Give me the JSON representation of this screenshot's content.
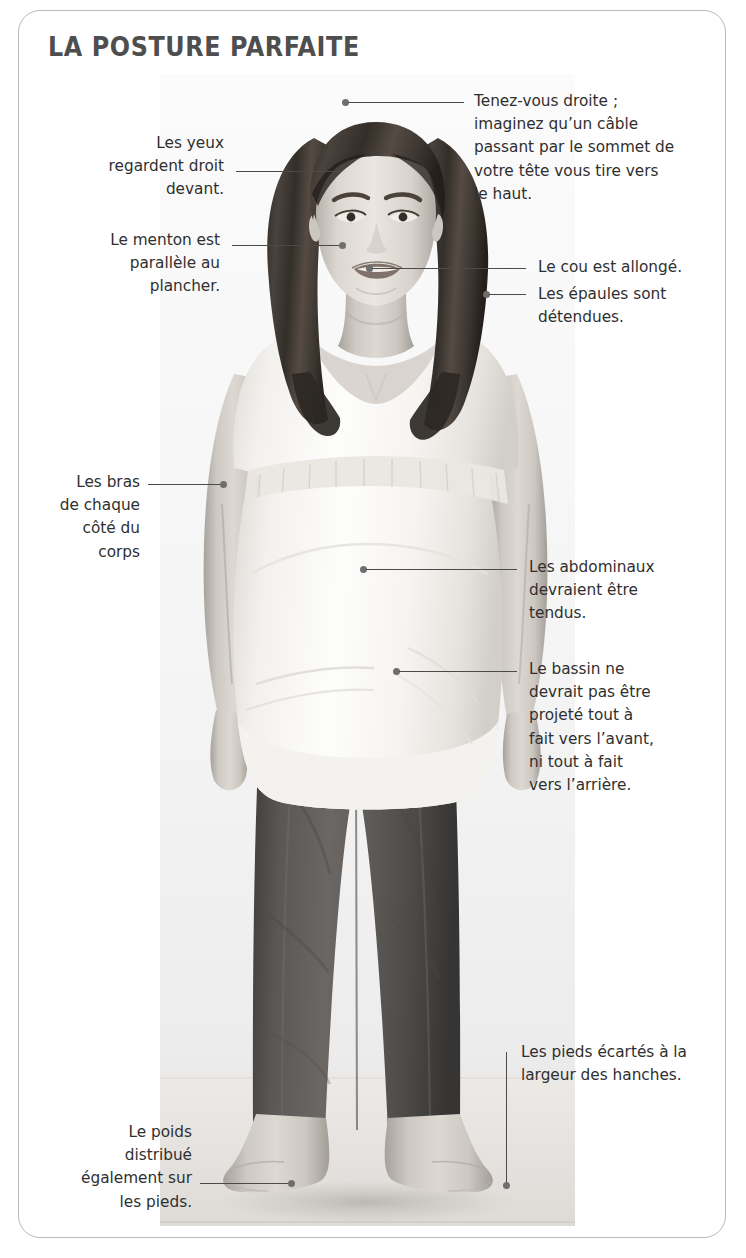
{
  "card": {
    "title": "LA POSTURE PARFAITE",
    "accent_color": "#4e4e4e",
    "border_color": "#b9b9b9",
    "text_color": "#2f2f2f",
    "leader_color": "#4a4a4a"
  },
  "figure": {
    "alt_name": "pregnant-woman-standing-front-view"
  },
  "callouts": {
    "eyes": {
      "label": "Les yeux\nregardent droit\ndevant.",
      "side": "left",
      "anchor": "eyes"
    },
    "head_top": {
      "label": "Tenez-vous droite ;\nimaginez qu’un câble\npassant par le sommet de\nvotre tête vous tire vers\nle haut.",
      "side": "right",
      "anchor": "top-of-head"
    },
    "chin": {
      "label": "Le menton est\nparallèle au\nplancher.",
      "side": "left",
      "anchor": "chin"
    },
    "neck": {
      "label": "Le cou est allongé.",
      "side": "right",
      "anchor": "neck"
    },
    "shoulders": {
      "label": "Les épaules sont\ndétendues.",
      "side": "right",
      "anchor": "shoulder"
    },
    "arms": {
      "label": "Les bras\nde chaque\ncôté du\ncorps",
      "side": "left",
      "anchor": "arm"
    },
    "abs": {
      "label": "Les abdominaux\ndevraient être\ntendus.",
      "side": "right",
      "anchor": "abdomen"
    },
    "pelvis": {
      "label": "Le bassin ne\ndevrait pas être\nprojeté tout à\nfait vers l’avant,\nni tout à fait\nvers l’arrière.",
      "side": "right",
      "anchor": "pelvis"
    },
    "feet_width": {
      "label": "Les pieds écartés à la\nlargeur des hanches.",
      "side": "right",
      "anchor": "right-foot"
    },
    "weight": {
      "label": "Le poids\ndistribué\négalement sur\nles pieds.",
      "side": "left",
      "anchor": "left-foot"
    }
  }
}
